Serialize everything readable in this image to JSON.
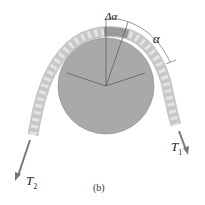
{
  "figure": {
    "caption": "(b)",
    "labels": {
      "delta_alpha": "Δα",
      "alpha": "α",
      "t1": "T",
      "t1_sub": "1",
      "t2": "T",
      "t2_sub": "2"
    },
    "colors": {
      "drum": "#a9a9a9",
      "rope": "#d6d6d6",
      "rope_dark": "#9a9a9a",
      "arrow": "#777777",
      "line": "#555555"
    }
  }
}
